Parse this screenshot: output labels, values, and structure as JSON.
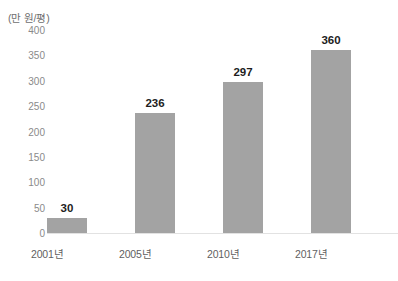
{
  "chart_data": {
    "type": "bar",
    "title": "",
    "subtitle": "",
    "xlabel": "",
    "ylabel": "(만 원/평)",
    "unit_caption": "(만 원/평)",
    "categories": [
      "2001년",
      "2005년",
      "2010년",
      "2017년"
    ],
    "values": [
      30,
      236,
      297,
      360
    ],
    "value_labels": [
      "30",
      "236",
      "297",
      "360"
    ],
    "ylim": [
      0,
      400
    ],
    "ytick_step": 50,
    "ytick_labels": [
      "400",
      "350",
      "300",
      "250",
      "200",
      "150",
      "100",
      "50",
      "0"
    ],
    "ytick_values": [
      400,
      350,
      300,
      250,
      200,
      150,
      100,
      50,
      0
    ],
    "grid": false,
    "legend": null,
    "legend_position": "none",
    "series": [
      {
        "name": "",
        "values": [
          30,
          236,
          297,
          360
        ],
        "color": "#a3a3a3"
      }
    ],
    "colors": {
      "bar": "#a3a3a3",
      "value_label": "#1d1d1d",
      "tick_label": "#8a8a8a",
      "category_label": "#5f5f5f",
      "baseline": "#e2e2e2",
      "background": "#ffffff"
    }
  }
}
